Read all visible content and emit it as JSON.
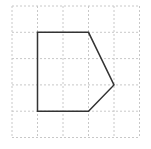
{
  "diagram": {
    "type": "polygon-on-grid",
    "grid": {
      "columns": 5,
      "rows": 5,
      "line_color": "#c8c8c8",
      "line_style": "dashed"
    },
    "shape": {
      "name": "pentagon",
      "stroke_color": "#333333",
      "vertices_grid_units": [
        [
          1,
          1
        ],
        [
          3,
          1
        ],
        [
          4,
          3
        ],
        [
          3,
          4
        ],
        [
          1,
          4
        ]
      ]
    }
  }
}
